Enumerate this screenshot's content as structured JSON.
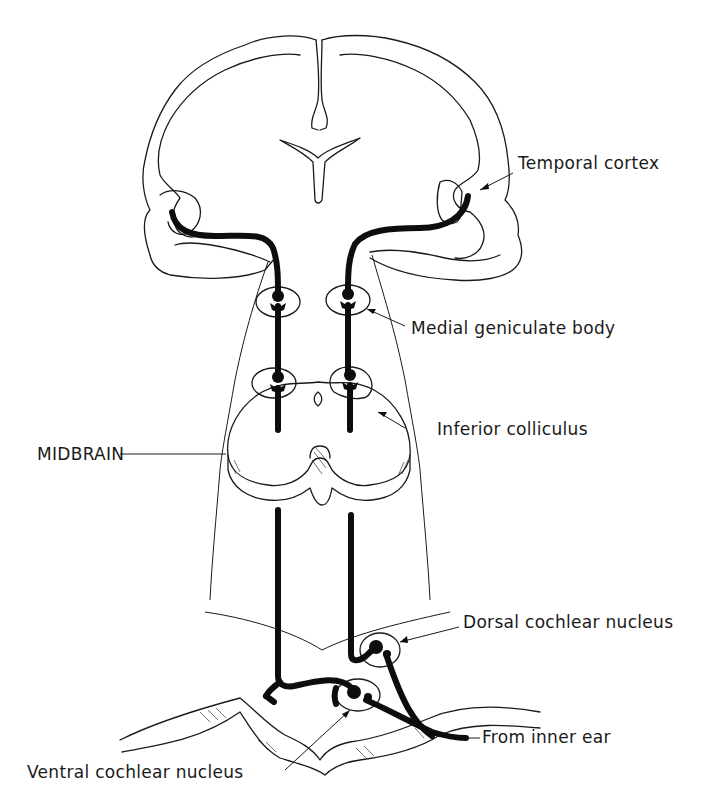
{
  "figure": {
    "type": "neuroanatomy-diagram",
    "colors": {
      "ink": "#1a1a1a",
      "tract": "#0d0d0d",
      "background": "#ffffff"
    }
  },
  "labels": {
    "temporal_cortex": "Temporal cortex",
    "medial_geniculate_body": "Medial geniculate body",
    "inferior_colliculus": "Inferior colliculus",
    "midbrain": "MIDBRAIN",
    "dorsal_cochlear_nucleus": "Dorsal cochlear nucleus",
    "from_inner_ear": "From inner ear",
    "ventral_cochlear_nucleus": "Ventral cochlear nucleus"
  },
  "structures": [
    "brain-coronal-section",
    "lateral-ventricle",
    "medial-geniculate-body-left",
    "medial-geniculate-body-right",
    "inferior-colliculus-left",
    "inferior-colliculus-right",
    "midbrain-section",
    "brainstem",
    "medulla-section",
    "dorsal-cochlear-nucleus",
    "ventral-cochlear-nucleus",
    "auditory-nerve"
  ]
}
